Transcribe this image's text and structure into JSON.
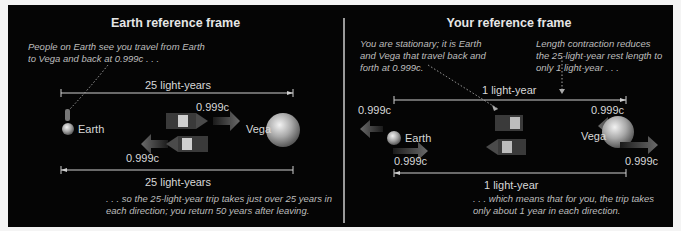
{
  "left_panel": {
    "title": "Earth reference frame",
    "note_top_line1": "People on Earth see you travel from Earth",
    "note_top_line2": "to Vega and back at 0.999c . . .",
    "distance_top": "25 light-years",
    "distance_bottom": "25 light-years",
    "speed_out": "0.999c",
    "speed_back": "0.999c",
    "earth_label": "Earth",
    "vega_label": "Vega",
    "note_bottom_line1": ". . . so the 25-light-year trip takes just over 25 years in",
    "note_bottom_line2": "each direction; you return 50 years after leaving."
  },
  "right_panel": {
    "title": "Your reference frame",
    "note_left_line1": "You are stationary; it is Earth",
    "note_left_line2": "and Vega that travel back and",
    "note_left_line3": "forth at 0.999c.",
    "note_right_line1": "Length contraction reduces",
    "note_right_line2": "the 25-light-year rest length to",
    "note_right_line3": "only 1 light-year . . .",
    "distance_top": "1 light-year",
    "distance_bottom": "1 light-year",
    "speed_earth_left": "0.999c",
    "speed_earth_right": "0.999c",
    "speed_vega_left": "0.999c",
    "speed_vega_right": "0.999c",
    "earth_label": "Earth",
    "vega_label": "Vega",
    "note_bottom_line1": ". . . which means that for you, the trip takes",
    "note_bottom_line2": "only about 1 year in each direction."
  },
  "colors": {
    "background": "#050505",
    "text": "#d8d8d8",
    "arrow": "#5a5a5a",
    "divider": "#9a9a9a"
  }
}
